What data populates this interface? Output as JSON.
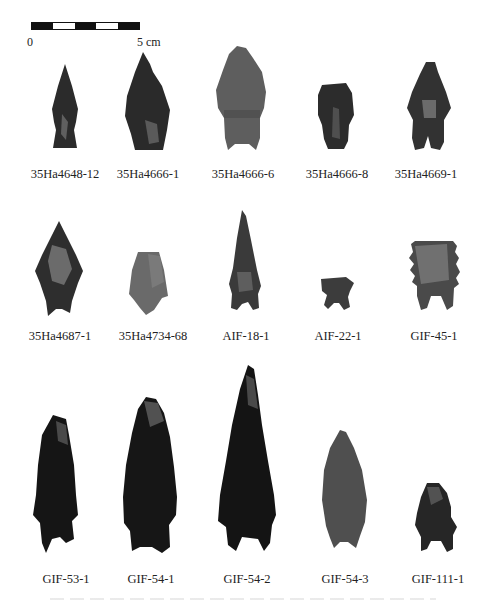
{
  "figure": {
    "scale_bar": {
      "start_label": "0",
      "end_label": "5 cm",
      "segments": [
        "dark",
        "light",
        "dark",
        "light",
        "dark"
      ]
    },
    "rows": [
      {
        "artifacts": [
          {
            "label": "35Ha4648-12",
            "tone": "#2b2b2b"
          },
          {
            "label": "35Ha4666-1",
            "tone": "#2a2a2a"
          },
          {
            "label": "35Ha4666-6",
            "tone": "#5e5e5e"
          },
          {
            "label": "35Ha4666-8",
            "tone": "#2c2c2c"
          },
          {
            "label": "35Ha4669-1",
            "tone": "#323232"
          }
        ]
      },
      {
        "artifacts": [
          {
            "label": "35Ha4687-1",
            "tone": "#2e2e2e"
          },
          {
            "label": "35Ha4734-68",
            "tone": "#6a6a6a"
          },
          {
            "label": "AIF-18-1",
            "tone": "#3a3a3a"
          },
          {
            "label": "AIF-22-1",
            "tone": "#3c3c3c"
          },
          {
            "label": "GIF-45-1",
            "tone": "#4a4a4a"
          }
        ]
      },
      {
        "artifacts": [
          {
            "label": "GIF-53-1",
            "tone": "#151515"
          },
          {
            "label": "GIF-54-1",
            "tone": "#161616"
          },
          {
            "label": "GIF-54-2",
            "tone": "#141414"
          },
          {
            "label": "GIF-54-3",
            "tone": "#4f4f4f"
          },
          {
            "label": "GIF-111-1",
            "tone": "#262626"
          }
        ]
      }
    ]
  }
}
